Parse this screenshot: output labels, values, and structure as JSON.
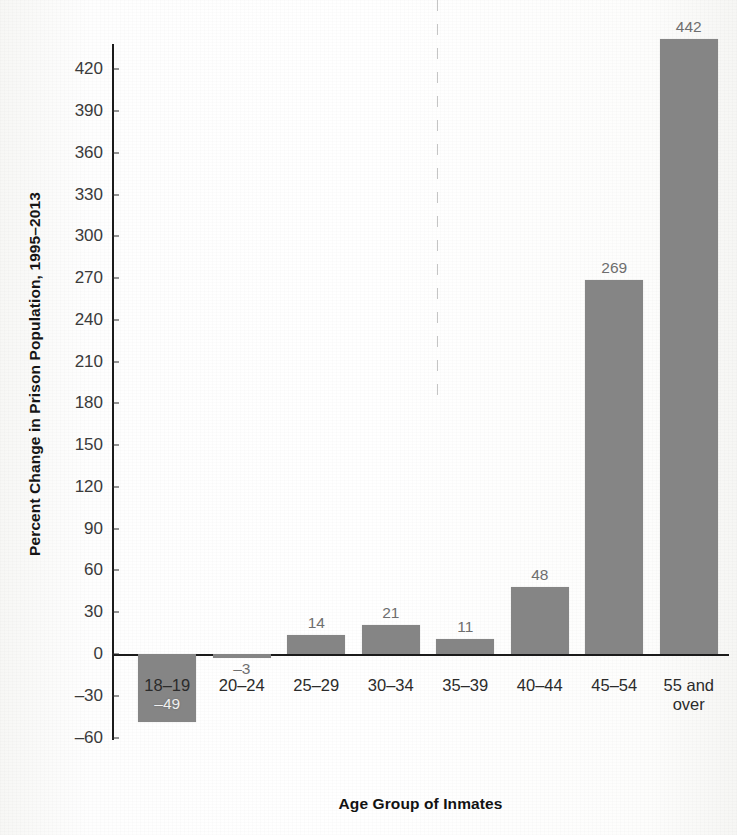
{
  "chart_data": {
    "type": "bar",
    "title": "",
    "subtitle": "",
    "xlabel": "Age Group of Inmates",
    "ylabel": "Percent Change in Prison Population, 1995–2013",
    "categories": [
      "18–19",
      "20–24",
      "25–29",
      "30–34",
      "35–39",
      "40–44",
      "45–54",
      "55 and\nover"
    ],
    "values": [
      -49,
      -3,
      14,
      21,
      11,
      48,
      269,
      442
    ],
    "value_labels": [
      "–49",
      "–3",
      "14",
      "21",
      "11",
      "48",
      "269",
      "442"
    ],
    "ylim": [
      -60,
      440
    ],
    "ytick_values": [
      440,
      420,
      390,
      360,
      330,
      300,
      270,
      240,
      210,
      180,
      150,
      120,
      90,
      60,
      30,
      0,
      -30,
      -60
    ],
    "ytick_labels": [
      "",
      "420",
      "390",
      "360",
      "330",
      "300",
      "270",
      "240",
      "210",
      "180",
      "150",
      "120",
      "90",
      "60",
      "30",
      "0",
      "–30",
      "–60"
    ],
    "grid": false,
    "legend": false,
    "legend_position": "none",
    "bar_color": "#858585",
    "axis_color": "#1b1b1b",
    "value_label_color": "#6e6e6e",
    "value_label_color_inside": "#f0f0f0",
    "tick_label_color": "#3a3a3a",
    "background": "#ffffff",
    "annotations": []
  }
}
